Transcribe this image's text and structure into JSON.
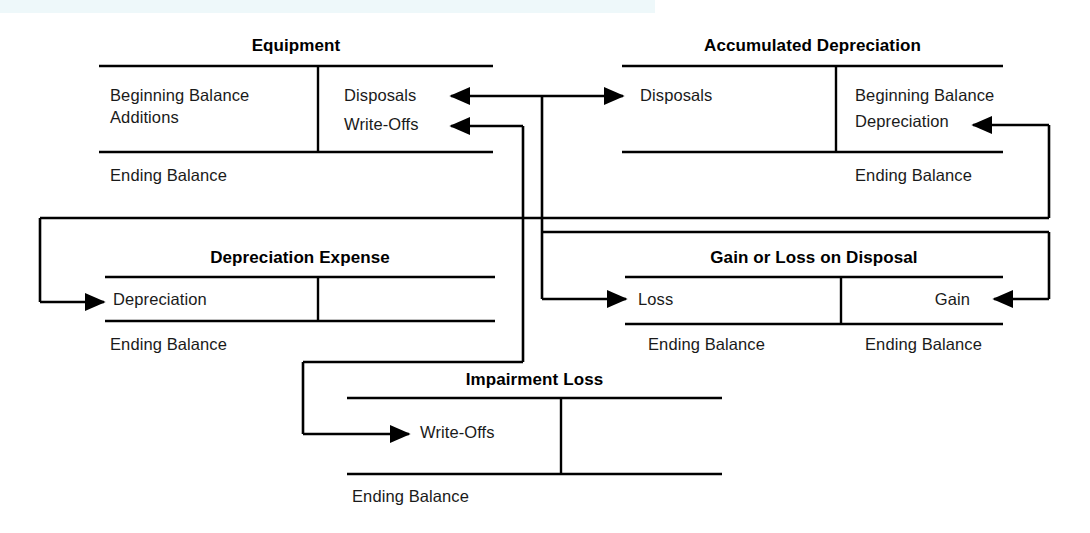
{
  "diagram": {
    "kind": "t-account-flow-diagram",
    "background_color": "#ffffff",
    "line_color": "#000000",
    "text_color": "#1a1a1a",
    "scan_band_color": "#eef8fa"
  },
  "accounts": {
    "equipment": {
      "title": "Equipment",
      "debits": [
        "Beginning Balance",
        "Additions"
      ],
      "credits": [
        "Disposals",
        "Write-Offs"
      ],
      "footer_left": "Ending Balance",
      "footer_right": ""
    },
    "accumulated_depreciation": {
      "title": "Accumulated Depreciation",
      "debits": [
        "Disposals"
      ],
      "credits": [
        "Beginning Balance",
        "Depreciation"
      ],
      "footer_left": "",
      "footer_right": "Ending Balance"
    },
    "depreciation_expense": {
      "title": "Depreciation Expense",
      "debits": [
        "Depreciation"
      ],
      "credits": [],
      "footer_left": "Ending Balance",
      "footer_right": ""
    },
    "gain_or_loss_on_disposal": {
      "title": "Gain or Loss on Disposal",
      "debits": [
        "Loss"
      ],
      "credits": [
        "Gain"
      ],
      "footer_left": "Ending Balance",
      "footer_right": "Ending Balance"
    },
    "impairment_loss": {
      "title": "Impairment Loss",
      "debits": [
        "Write-Offs"
      ],
      "credits": [],
      "footer_left": "Ending Balance",
      "footer_right": ""
    }
  },
  "connectors": [
    {
      "name": "equipment-disposals-to-accumdep-disposals",
      "from": "Equipment: Disposals",
      "to": "Accumulated Depreciation: Disposals"
    },
    {
      "name": "equipment-disposals-to-gainloss-loss",
      "from": "Equipment: Disposals",
      "to": "Gain or Loss on Disposal: Loss"
    },
    {
      "name": "accumdep-endingbalance-to-depreciation",
      "from": "Accumulated Depreciation: Ending Balance",
      "to": "Accumulated Depreciation: Depreciation"
    },
    {
      "name": "accumdep-to-depreciation-expense",
      "from": "Accumulated Depreciation",
      "to": "Depreciation Expense: Depreciation"
    },
    {
      "name": "accumdep-to-gainloss-gain",
      "from": "Accumulated Depreciation",
      "to": "Gain or Loss on Disposal: Gain"
    },
    {
      "name": "equipment-writeoffs-to-impairment-writeoffs",
      "from": "Equipment: Write-Offs",
      "to": "Impairment Loss: Write-Offs"
    }
  ]
}
